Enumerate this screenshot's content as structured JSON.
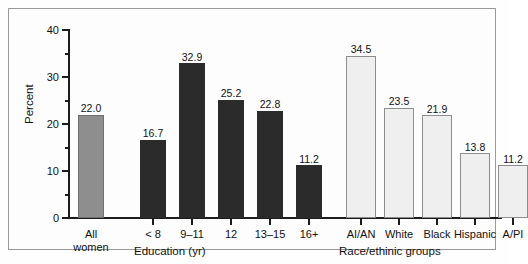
{
  "chart_data": {
    "type": "bar",
    "title": "",
    "xlabel": "",
    "ylabel": "Percent",
    "ylim": [
      0,
      40
    ],
    "yticks": [
      0,
      10,
      20,
      30,
      40
    ],
    "yminorticks": [
      5,
      15,
      25,
      35
    ],
    "grid": false,
    "legend": "none",
    "groups": [
      {
        "name": "overall",
        "axis_label": "",
        "bars": [
          {
            "category": "All women",
            "value": 22.0,
            "label": "22.0",
            "style": "all"
          }
        ]
      },
      {
        "name": "education",
        "axis_label": "Education (yr)",
        "bars": [
          {
            "category": "< 8",
            "value": 16.7,
            "label": "16.7",
            "style": "edu"
          },
          {
            "category": "9–11",
            "value": 32.9,
            "label": "32.9",
            "style": "edu"
          },
          {
            "category": "12",
            "value": 25.2,
            "label": "25.2",
            "style": "edu"
          },
          {
            "category": "13–15",
            "value": 22.8,
            "label": "22.8",
            "style": "edu"
          },
          {
            "category": "16+",
            "value": 11.2,
            "label": "11.2",
            "style": "edu"
          }
        ]
      },
      {
        "name": "race_ethnic",
        "axis_label": "Race/ethinic groups",
        "bars": [
          {
            "category": "AI/AN",
            "value": 34.5,
            "label": "34.5",
            "style": "race"
          },
          {
            "category": "White",
            "value": 23.5,
            "label": "23.5",
            "style": "race"
          },
          {
            "category": "Black",
            "value": 21.9,
            "label": "21.9",
            "style": "race"
          },
          {
            "category": "Hispanic",
            "value": 13.8,
            "label": "13.8",
            "style": "race"
          },
          {
            "category": "A/PI",
            "value": 11.2,
            "label": "11.2",
            "style": "race"
          }
        ]
      }
    ],
    "colors": {
      "all_women_bar": "#8e8e8e",
      "education_bar": "#2b2b2b",
      "race_bar": "#efefef",
      "axis": "#1c1c1c",
      "frame": "#9a9a9a",
      "background": "#fdfdfd"
    }
  },
  "caption": {
    "text": ""
  }
}
